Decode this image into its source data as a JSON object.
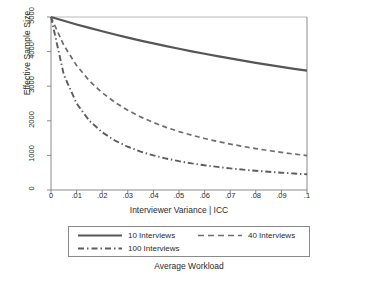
{
  "chart_data": {
    "type": "line",
    "title": "",
    "xlabel": "Interviewer Variance | ICC",
    "ylabel": "Effective Sample Size",
    "xlim": [
      0,
      0.1
    ],
    "ylim": [
      0,
      5000
    ],
    "grid": false,
    "legend_position": "bottom",
    "legend_title": "Average Workload",
    "xticks": [
      "0",
      ".01",
      ".02",
      ".03",
      ".04",
      ".05",
      ".06",
      ".07",
      ".08",
      ".09",
      ".1"
    ],
    "xtick_values": [
      0,
      0.01,
      0.02,
      0.03,
      0.04,
      0.05,
      0.06,
      0.07,
      0.08,
      0.09,
      0.1
    ],
    "yticks": [
      "0",
      "1000",
      "2000",
      "3000",
      "4000",
      "5000"
    ],
    "ytick_values": [
      0,
      1000,
      2000,
      3000,
      4000,
      5000
    ],
    "x": [
      0,
      0.005,
      0.01,
      0.015,
      0.02,
      0.025,
      0.03,
      0.035,
      0.04,
      0.045,
      0.05,
      0.055,
      0.06,
      0.065,
      0.07,
      0.075,
      0.08,
      0.085,
      0.09,
      0.095,
      0.1
    ],
    "series": [
      {
        "name": "10 Interviews",
        "style": "solid",
        "color": "#565656",
        "values": [
          5000,
          4890,
          4785,
          4684,
          4587,
          4494,
          4405,
          4319,
          4237,
          4158,
          4082,
          4008,
          3937,
          3868,
          3802,
          3738,
          3676,
          3617,
          3559,
          3503,
          3448
        ]
      },
      {
        "name": "40 Interviews",
        "style": "dashed",
        "color": "#6e6e6e",
        "values": [
          5000,
          4184,
          3597,
          3155,
          2809,
          2532,
          2304,
          2113,
          1950,
          1811,
          1689,
          1582,
          1488,
          1403,
          1328,
          1259,
          1196,
          1139,
          1087,
          1039,
          994
        ]
      },
      {
        "name": "100 Interviews",
        "style": "dashdot",
        "color": "#5d5d5d",
        "values": [
          5000,
          3333,
          2500,
          2000,
          1667,
          1429,
          1250,
          1111,
          1000,
          909,
          833,
          769,
          714,
          667,
          625,
          588,
          556,
          526,
          500,
          476,
          455
        ]
      }
    ]
  },
  "legend": {
    "items": [
      {
        "label": "10 Interviews",
        "style": "solid"
      },
      {
        "label": "40 Interviews",
        "style": "dashed"
      },
      {
        "label": "100 Interviews",
        "style": "dashdot"
      }
    ],
    "caption": "Average Workload"
  },
  "colors": {
    "axis": "#8a8a8a",
    "text": "#2b2b2b",
    "line_solid": "#565656",
    "line_dashed": "#6e6e6e",
    "line_dashdot": "#5d5d5d",
    "background": "#ffffff"
  }
}
